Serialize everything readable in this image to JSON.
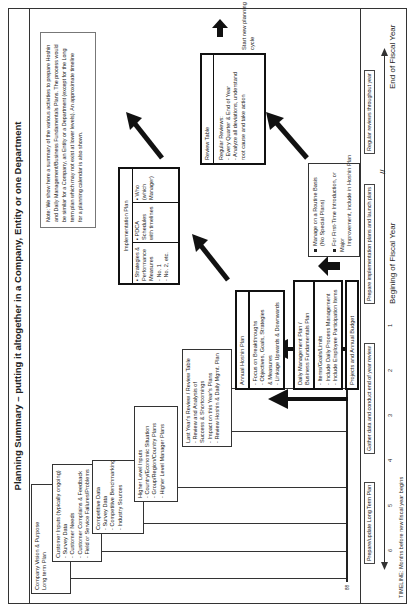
{
  "title": "Planning Summary – putting it altogether in a Company, Entity or one Department",
  "note": {
    "lines": [
      "Note: We show here a summary of the various activities to prepare Hoshin",
      "and Daily Management/Business Fundamentals Plans. The process would",
      "be similar for a Company, an Entity or a Department (except for the Long",
      "term plan which may not exist at lower levels). An approximate timeline",
      "for a planning calendar is also shown."
    ]
  },
  "inputs": [
    {
      "lines": [
        "Company Vision & Purpose",
        "Long term Plan"
      ]
    },
    {
      "lines": [
        "Customer Inputs (typically ongoing)",
        "- Survey Data",
        "- Customer Needs",
        "- Customer Complains & Feedback",
        "- Field or Service Failures/Problems"
      ]
    },
    {
      "lines": [
        "Competitive Data",
        "- Survey Data",
        "- Competitive Benchmarking",
        "- Industry Sources"
      ]
    },
    {
      "lines": [
        "Higher Level Inputs",
        "- Country/Economic Situation",
        "- Group/Region/Country Plans",
        "- Higher Level Manager Plans"
      ]
    },
    {
      "lines": [
        "Last Year's Review / Review Table",
        "- Review and Analysis of",
        "  Success & Shortcomings",
        "- Impact on this Year's Plans",
        "- Review Hoshin & Daily Mgmt. Plan"
      ]
    }
  ],
  "hoshin_plan": {
    "header": "Annual Hoshin Plan",
    "lines": [
      "- Focus on Breakthroughs",
      "- Objectives, Goals, Strategies",
      "  & Measures",
      "- Linkage Upwards & Downwards"
    ]
  },
  "daily_plan": {
    "header": [
      "Daily Management Plan /",
      "Business Fundamentals Plan"
    ],
    "lines": [
      "- Items/Goals/Limits",
      "- Include Daily Process Management",
      "- Include Employee Participation Items"
    ]
  },
  "projects_budget": "Projects and Annual Budget",
  "implementation_plan": {
    "header": "Implementation Plan",
    "columns": [
      [
        "▪ Strategies &",
        "Performance",
        "Measures",
        "- No. 1",
        "- No. 2, etc."
      ],
      [
        "▪ PDCA",
        "Schedules",
        "with timelines"
      ],
      [
        "▪ Who",
        "(which",
        "Manager)"
      ]
    ]
  },
  "routine_box": {
    "items": [
      [
        "Manage on a Routine Basis",
        "(No Special Plans)"
      ],
      [
        "For First-Time Introduction, or Major",
        "Improvement, include in Hoshin Plan"
      ]
    ]
  },
  "review_table": {
    "header": "Review Table",
    "lines": [
      "Regular Reviews:",
      "- Every Quarter & End of Year",
      "- Analyze all deviations, understand",
      "  root cause and take action"
    ]
  },
  "new_cycle": [
    "Start",
    "new planning",
    "cycle"
  ],
  "timeline": {
    "boxes": [
      [
        "Prepare/update",
        "Long Term Plan"
      ],
      [
        "Gather data and conduct",
        "end of year review"
      ],
      [
        "Prepare implementation plans",
        "and launch plans"
      ],
      [
        "Regular reviews throughout year"
      ]
    ],
    "months": [
      "6",
      "5",
      "4",
      "3",
      "2",
      "1"
    ],
    "beginning_label": "Begining of Fiscal Year",
    "end_label": "End of Fiscal Year",
    "caption": "TIMELINE: Months before new fiscal year begins"
  },
  "page_mark": "88"
}
